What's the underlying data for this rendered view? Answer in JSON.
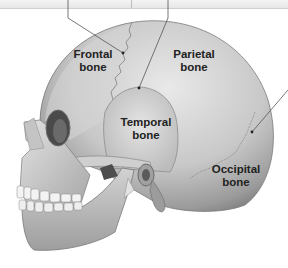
{
  "figure": {
    "labels": [
      {
        "id": "frontal",
        "line1": "Frontal",
        "line2": "bone"
      },
      {
        "id": "parietal",
        "line1": "Parietal",
        "line2": "bone"
      },
      {
        "id": "temporal",
        "line1": "Temporal",
        "line2": "bone"
      },
      {
        "id": "occipital",
        "line1": "Occipital",
        "line2": "bone"
      }
    ],
    "leader_lines": [
      {
        "id": "coronal-suture-pointer",
        "target": "frontal-parietal suture"
      },
      {
        "id": "squamous-suture-pointer",
        "target": "temporal-parietal suture"
      },
      {
        "id": "lambdoid-suture-pointer",
        "target": "parietal-occipital suture"
      }
    ]
  },
  "colors": {
    "background": "#ffffff",
    "bone_light": "#dcdcdc",
    "bone_mid": "#b4b4b4",
    "bone_dark": "#6e6e6e",
    "label_text": "#222222",
    "leader_line": "#555555"
  }
}
